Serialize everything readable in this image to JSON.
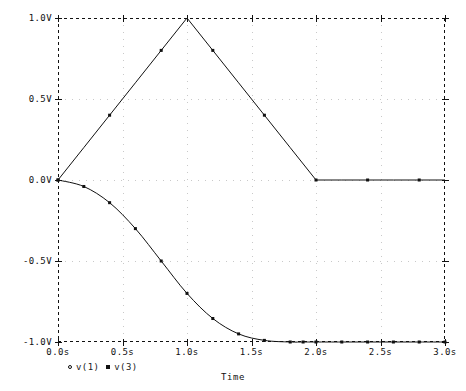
{
  "chart_data": {
    "type": "line",
    "title": "",
    "xlabel": "Time",
    "ylabel": "",
    "xlim": [
      0.0,
      3.0
    ],
    "ylim": [
      -1.0,
      1.0
    ],
    "grid": true,
    "legend_position": "bottom-left",
    "x_ticks": [
      "0.0s",
      "0.5s",
      "1.0s",
      "1.5s",
      "2.0s",
      "2.5s",
      "3.0s"
    ],
    "x_tick_values": [
      0.0,
      0.5,
      1.0,
      1.5,
      2.0,
      2.5,
      3.0
    ],
    "y_ticks": [
      "1.0V",
      "0.5V",
      "0.0V",
      "-0.5V",
      "-1.0V"
    ],
    "y_tick_values": [
      1.0,
      0.5,
      0.0,
      -0.5,
      -1.0
    ],
    "series": [
      {
        "name": "v(1)",
        "marker": "circle",
        "color": "#111111",
        "x": [
          0.0,
          0.2,
          0.4,
          0.6,
          0.8,
          1.0,
          1.2,
          1.4,
          1.6,
          1.8,
          2.0,
          2.2,
          2.4,
          2.6,
          2.8,
          3.0
        ],
        "values": [
          0.0,
          0.2,
          0.4,
          0.6,
          0.8,
          1.0,
          0.8,
          0.6,
          0.4,
          0.2,
          0.0,
          0.0,
          0.0,
          0.0,
          0.0,
          0.0
        ]
      },
      {
        "name": "v(3)",
        "marker": "square",
        "color": "#111111",
        "x": [
          0.0,
          0.2,
          0.4,
          0.6,
          0.8,
          1.0,
          1.2,
          1.4,
          1.6,
          1.8,
          1.9,
          2.0,
          2.2,
          2.4,
          2.6,
          2.8,
          3.0
        ],
        "values": [
          0.0,
          -0.04,
          -0.14,
          -0.3,
          -0.5,
          -0.7,
          -0.855,
          -0.95,
          -0.99,
          -1.0,
          -1.0,
          -1.0,
          -1.0,
          -1.0,
          -1.0,
          -1.0,
          -1.0
        ]
      }
    ]
  },
  "axis": {
    "x_title": "Time"
  },
  "legend": {
    "entries": [
      {
        "marker": "circle-marker",
        "label": "v(1)"
      },
      {
        "marker": "square-marker",
        "label": "v(3)"
      }
    ]
  }
}
